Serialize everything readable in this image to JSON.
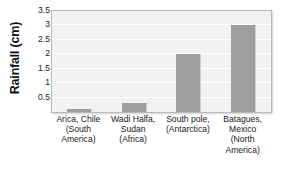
{
  "chart_data": {
    "type": "bar",
    "title": "",
    "subtitle": "",
    "xlabel": "",
    "ylabel": "Rainfall (cm)",
    "categories": [
      "Arica, Chile (South America)",
      "Wadi Halfa, Sudan (Africa)",
      "South pole, (Antarctica)",
      "Batagues, Mexico (North America)"
    ],
    "category_lines": [
      [
        "Arica, Chile",
        "(South",
        "America)"
      ],
      [
        "Wadi Halfa,",
        "Sudan",
        "(Africa)"
      ],
      [
        "South pole,",
        "(Antarctica)"
      ],
      [
        "Batagues,",
        "Mexico",
        "(North",
        "America)"
      ]
    ],
    "values": [
      0.1,
      0.3,
      2.0,
      3.0
    ],
    "ylim": [
      0,
      3.5
    ],
    "yticks": [
      0.5,
      1,
      1.5,
      2,
      2.5,
      3,
      3.5
    ],
    "ytick_labels": [
      "0.5",
      "1",
      "1.5",
      "2",
      "2.5",
      "3",
      "3.5"
    ],
    "grid": true,
    "grid_orientation": "horizontal",
    "legend": false,
    "legend_position": "none",
    "bar_color": "#9e9e9e",
    "plot_background": "#f2f2f2",
    "gridline_color": "#ffffff",
    "border_color": "#b9b9b9"
  }
}
